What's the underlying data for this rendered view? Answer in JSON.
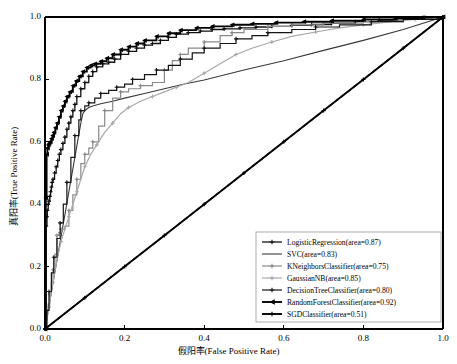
{
  "figure": {
    "background": "#ffffff",
    "plot_background": "#ffffff",
    "axis_color": "#000000"
  },
  "axes": {
    "xlabel": "假阳率(False Positive Rate)",
    "ylabel": "真阳率(True Positive Rate)",
    "xticks": [
      "0.0",
      "0.2",
      "0.4",
      "0.6",
      "0.8",
      "1.0"
    ],
    "yticks": [
      "0.0",
      "0.2",
      "0.4",
      "0.6",
      "0.8",
      "1.0"
    ]
  },
  "legend": {
    "entries": [
      {
        "label": "LogisticRegression(area=0.87)",
        "color": "#111111",
        "width": 1.3,
        "marker": "plus"
      },
      {
        "label": "SVC(area=0.83)",
        "color": "#3a3a3a",
        "width": 1.1,
        "marker": "none"
      },
      {
        "label": "KNeighborsClassifier(area=0.75)",
        "color": "#8a8a8a",
        "width": 1.2,
        "marker": "plus"
      },
      {
        "label": "GaussianNB(area=0.85)",
        "color": "#a8a8a8",
        "width": 1.2,
        "marker": "plus"
      },
      {
        "label": "DecisionTreeClassifier(area=0.80)",
        "color": "#151515",
        "width": 1.2,
        "marker": "plus"
      },
      {
        "label": "RandomForestClassifier(area=0.92)",
        "color": "#000000",
        "width": 1.9,
        "marker": "triangle"
      },
      {
        "label": "SGDClassifier(area=0.51)",
        "color": "#000000",
        "width": 1.9,
        "marker": "plus"
      }
    ]
  },
  "chart_data": {
    "type": "line",
    "title": "",
    "xlabel": "假阳率(False Positive Rate)",
    "ylabel": "真阳率(True Positive Rate)",
    "xlim": [
      0.0,
      1.0
    ],
    "ylim": [
      0.0,
      1.0
    ],
    "grid": false,
    "legend_position": "lower-right",
    "reference_line": {
      "name": "chance-diagonal",
      "style": "dashed",
      "color": "#000000",
      "x": [
        0.0,
        1.0
      ],
      "y": [
        0.0,
        1.0
      ]
    },
    "series": [
      {
        "name": "LogisticRegression",
        "area": 0.87,
        "x": [
          0.0,
          0.003,
          0.005,
          0.006,
          0.008,
          0.01,
          0.012,
          0.014,
          0.016,
          0.018,
          0.02,
          0.024,
          0.028,
          0.032,
          0.036,
          0.04,
          0.045,
          0.05,
          0.055,
          0.06,
          0.065,
          0.07,
          0.075,
          0.08,
          0.09,
          0.1,
          0.11,
          0.12,
          0.13,
          0.145,
          0.16,
          0.175,
          0.19,
          0.21,
          0.23,
          0.25,
          0.27,
          0.29,
          0.31,
          0.33,
          0.36,
          0.39,
          0.42,
          0.45,
          0.49,
          0.53,
          0.57,
          0.62,
          0.67,
          0.72,
          0.78,
          0.84,
          0.9,
          0.95,
          1.0
        ],
        "y": [
          0.0,
          0.33,
          0.36,
          0.38,
          0.4,
          0.41,
          0.425,
          0.44,
          0.455,
          0.47,
          0.48,
          0.5,
          0.52,
          0.54,
          0.56,
          0.575,
          0.595,
          0.615,
          0.64,
          0.66,
          0.68,
          0.7,
          0.72,
          0.745,
          0.77,
          0.79,
          0.81,
          0.825,
          0.84,
          0.85,
          0.855,
          0.865,
          0.88,
          0.89,
          0.9,
          0.91,
          0.915,
          0.925,
          0.935,
          0.945,
          0.95,
          0.955,
          0.96,
          0.962,
          0.965,
          0.968,
          0.97,
          0.973,
          0.976,
          0.98,
          0.985,
          0.99,
          0.995,
          0.998,
          1.0
        ]
      },
      {
        "name": "SVC",
        "area": 0.83,
        "x": [
          0.0,
          0.09,
          0.095,
          0.1,
          0.11,
          0.12,
          0.14,
          0.17,
          0.2,
          0.25,
          0.3,
          0.35,
          0.4,
          0.5,
          0.6,
          0.7,
          0.8,
          0.9,
          1.0
        ],
        "y": [
          0.0,
          0.66,
          0.69,
          0.7,
          0.71,
          0.715,
          0.722,
          0.73,
          0.74,
          0.755,
          0.77,
          0.785,
          0.798,
          0.83,
          0.86,
          0.893,
          0.925,
          0.96,
          1.0
        ]
      },
      {
        "name": "KNeighborsClassifier",
        "area": 0.75,
        "x": [
          0.0,
          0.003,
          0.005,
          0.008,
          0.012,
          0.016,
          0.02,
          0.025,
          0.03,
          0.035,
          0.04,
          0.05,
          0.06,
          0.07,
          0.08,
          0.09,
          0.1,
          0.11,
          0.12,
          0.135,
          0.15,
          0.17,
          0.19,
          0.21,
          0.24,
          0.27,
          0.3,
          0.32,
          0.34,
          0.36,
          0.4,
          0.44,
          0.47,
          0.5,
          0.56,
          0.62,
          0.7,
          0.8,
          0.9,
          1.0
        ],
        "y": [
          0.0,
          0.04,
          0.06,
          0.08,
          0.11,
          0.15,
          0.19,
          0.24,
          0.3,
          0.31,
          0.32,
          0.33,
          0.38,
          0.43,
          0.48,
          0.53,
          0.56,
          0.58,
          0.6,
          0.65,
          0.7,
          0.74,
          0.76,
          0.77,
          0.78,
          0.79,
          0.83,
          0.86,
          0.88,
          0.9,
          0.92,
          0.94,
          0.95,
          0.96,
          0.97,
          0.975,
          0.98,
          0.985,
          0.992,
          1.0
        ]
      },
      {
        "name": "GaussianNB",
        "area": 0.85,
        "x": [
          0.0,
          0.005,
          0.01,
          0.015,
          0.02,
          0.03,
          0.04,
          0.05,
          0.06,
          0.07,
          0.08,
          0.09,
          0.1,
          0.115,
          0.13,
          0.15,
          0.17,
          0.19,
          0.21,
          0.24,
          0.27,
          0.3,
          0.33,
          0.36,
          0.4,
          0.44,
          0.48,
          0.52,
          0.57,
          0.62,
          0.68,
          0.74,
          0.8,
          0.87,
          0.93,
          1.0
        ],
        "y": [
          0.0,
          0.03,
          0.07,
          0.11,
          0.15,
          0.22,
          0.28,
          0.32,
          0.36,
          0.4,
          0.44,
          0.48,
          0.52,
          0.56,
          0.59,
          0.63,
          0.66,
          0.69,
          0.71,
          0.73,
          0.745,
          0.76,
          0.775,
          0.79,
          0.82,
          0.85,
          0.88,
          0.9,
          0.92,
          0.938,
          0.952,
          0.965,
          0.975,
          0.985,
          0.992,
          1.0
        ]
      },
      {
        "name": "DecisionTreeClassifier",
        "area": 0.8,
        "x": [
          0.0,
          0.005,
          0.01,
          0.016,
          0.022,
          0.03,
          0.038,
          0.046,
          0.055,
          0.065,
          0.075,
          0.085,
          0.09,
          0.1,
          0.11,
          0.125,
          0.14,
          0.16,
          0.18,
          0.2,
          0.22,
          0.25,
          0.28,
          0.31,
          0.34,
          0.37,
          0.4,
          0.44,
          0.48,
          0.52,
          0.56,
          0.62,
          0.68,
          0.74,
          0.82,
          0.9,
          1.0
        ],
        "y": [
          0.0,
          0.06,
          0.12,
          0.18,
          0.23,
          0.29,
          0.34,
          0.4,
          0.47,
          0.55,
          0.62,
          0.67,
          0.7,
          0.715,
          0.725,
          0.74,
          0.755,
          0.765,
          0.775,
          0.785,
          0.8,
          0.815,
          0.83,
          0.845,
          0.865,
          0.885,
          0.9,
          0.915,
          0.93,
          0.94,
          0.95,
          0.96,
          0.968,
          0.975,
          0.985,
          0.992,
          1.0
        ]
      },
      {
        "name": "RandomForestClassifier",
        "area": 0.92,
        "x": [
          0.0,
          0.002,
          0.004,
          0.006,
          0.008,
          0.01,
          0.013,
          0.016,
          0.019,
          0.022,
          0.026,
          0.03,
          0.035,
          0.04,
          0.045,
          0.05,
          0.055,
          0.062,
          0.07,
          0.078,
          0.086,
          0.095,
          0.105,
          0.115,
          0.125,
          0.14,
          0.155,
          0.17,
          0.19,
          0.21,
          0.23,
          0.25,
          0.28,
          0.31,
          0.34,
          0.38,
          0.42,
          0.47,
          0.52,
          0.58,
          0.65,
          0.72,
          0.8,
          0.88,
          0.95,
          1.0
        ],
        "y": [
          0.0,
          0.42,
          0.56,
          0.58,
          0.59,
          0.595,
          0.6,
          0.61,
          0.62,
          0.63,
          0.645,
          0.66,
          0.68,
          0.7,
          0.715,
          0.73,
          0.745,
          0.76,
          0.78,
          0.795,
          0.81,
          0.825,
          0.838,
          0.845,
          0.85,
          0.858,
          0.868,
          0.88,
          0.895,
          0.905,
          0.915,
          0.925,
          0.938,
          0.948,
          0.958,
          0.965,
          0.97,
          0.975,
          0.978,
          0.982,
          0.985,
          0.988,
          0.992,
          0.996,
          0.998,
          1.0
        ]
      },
      {
        "name": "SGDClassifier",
        "area": 0.51,
        "x": [
          0.0,
          0.1,
          0.2,
          0.3,
          0.4,
          0.5,
          0.6,
          0.7,
          0.8,
          0.9,
          1.0
        ],
        "y": [
          0.0,
          0.1,
          0.2,
          0.3,
          0.4,
          0.5,
          0.6,
          0.7,
          0.8,
          0.9,
          1.0
        ]
      }
    ]
  }
}
